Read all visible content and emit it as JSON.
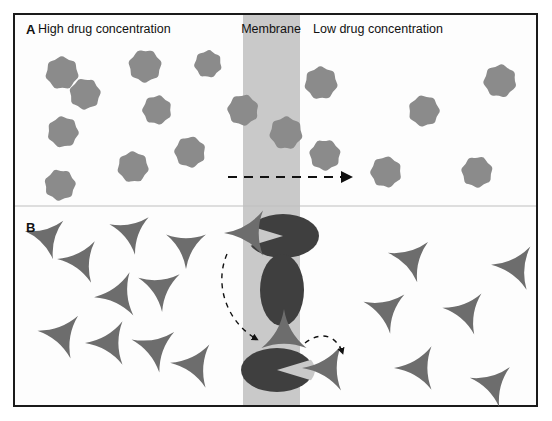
{
  "figure": {
    "frame": {
      "x": 14,
      "y": 14,
      "width": 523,
      "height": 392,
      "stroke": "#1a1a1a",
      "stroke_width": 2,
      "fill": "#fdfdfd"
    },
    "membrane": {
      "x": 243,
      "y": 14,
      "width": 57,
      "height": 392,
      "color": "#c9c9c9",
      "label": "Membrane",
      "label_x": 271,
      "label_y": 33
    }
  },
  "labels": {
    "panel_a_letter": "A",
    "panel_a_letter_x": 26,
    "panel_a_letter_y": 34,
    "panel_a_left_title": "High drug concentration",
    "panel_a_left_title_x": 38,
    "panel_a_left_title_y": 33,
    "panel_a_right_title": "Low drug concentration",
    "panel_a_right_title_x": 313,
    "panel_a_right_title_y": 33,
    "panel_b_letter": "B",
    "panel_b_letter_x": 26,
    "panel_b_letter_y": 232,
    "membrane_label": "Membrane"
  },
  "colors": {
    "drug_star": "#8b8b8b",
    "drug_triangle": "#6d6d6d",
    "transporter": "#3f3f3f",
    "membrane_band": "#c9c9c9",
    "frame_stroke": "#1a1a1a",
    "arrow": "#111111",
    "text": "#111111",
    "background": "#fdfdfd"
  },
  "panel_a": {
    "name": "passive-diffusion",
    "divider_y": 206,
    "stars_left": [
      {
        "cx": 62,
        "cy": 73,
        "r": 18,
        "rot": 12
      },
      {
        "cx": 145,
        "cy": 66,
        "r": 18,
        "rot": 40
      },
      {
        "cx": 208,
        "cy": 64,
        "r": 15,
        "rot": 70
      },
      {
        "cx": 85,
        "cy": 94,
        "r": 17,
        "rot": 95
      },
      {
        "cx": 157,
        "cy": 110,
        "r": 16,
        "rot": 25
      },
      {
        "cx": 63,
        "cy": 132,
        "r": 17,
        "rot": 55
      },
      {
        "cx": 190,
        "cy": 152,
        "r": 17,
        "rot": 80
      },
      {
        "cx": 133,
        "cy": 167,
        "r": 17,
        "rot": 10
      },
      {
        "cx": 60,
        "cy": 185,
        "r": 17,
        "rot": 45
      }
    ],
    "stars_membrane": [
      {
        "cx": 243,
        "cy": 110,
        "r": 17,
        "rot": 30
      },
      {
        "cx": 321,
        "cy": 83,
        "r": 18,
        "rot": 62
      },
      {
        "cx": 286,
        "cy": 133,
        "r": 18,
        "rot": 15
      },
      {
        "cx": 325,
        "cy": 155,
        "r": 17,
        "rot": 88
      }
    ],
    "stars_right": [
      {
        "cx": 500,
        "cy": 81,
        "r": 18,
        "rot": 20
      },
      {
        "cx": 424,
        "cy": 111,
        "r": 17,
        "rot": 50
      },
      {
        "cx": 386,
        "cy": 172,
        "r": 17,
        "rot": 75
      },
      {
        "cx": 477,
        "cy": 172,
        "r": 17,
        "rot": 35
      }
    ],
    "diffusion_arrow": {
      "x1": 228,
      "y1": 177,
      "x2": 352,
      "y2": 177,
      "dash": "9 7",
      "label": "diffusion-direction"
    }
  },
  "panel_b": {
    "name": "carrier-mediated-transport",
    "triangles_left": [
      {
        "cx": 47,
        "cy": 237,
        "s": 23,
        "rot": 195
      },
      {
        "cx": 131,
        "cy": 232,
        "s": 23,
        "rot": 200
      },
      {
        "cx": 81,
        "cy": 261,
        "s": 24,
        "rot": 185
      },
      {
        "cx": 186,
        "cy": 246,
        "s": 23,
        "rot": 210
      },
      {
        "cx": 119,
        "cy": 295,
        "s": 25,
        "rot": 175
      },
      {
        "cx": 160,
        "cy": 288,
        "s": 24,
        "rot": 205
      },
      {
        "cx": 62,
        "cy": 335,
        "s": 25,
        "rot": 190
      },
      {
        "cx": 110,
        "cy": 343,
        "s": 25,
        "rot": 180
      },
      {
        "cx": 155,
        "cy": 348,
        "s": 25,
        "rot": 200
      },
      {
        "cx": 195,
        "cy": 365,
        "s": 25,
        "rot": 185
      }
    ],
    "triangles_right": [
      {
        "cx": 411,
        "cy": 259,
        "s": 24,
        "rot": 195
      },
      {
        "cx": 516,
        "cy": 267,
        "s": 25,
        "rot": 185
      },
      {
        "cx": 386,
        "cy": 310,
        "s": 24,
        "rot": 200
      },
      {
        "cx": 466,
        "cy": 312,
        "s": 24,
        "rot": 190
      },
      {
        "cx": 419,
        "cy": 368,
        "s": 25,
        "rot": 180
      },
      {
        "cx": 493,
        "cy": 384,
        "s": 24,
        "rot": 195
      }
    ],
    "transporters": [
      {
        "name": "transporter-top-loaded",
        "cx": 283,
        "cy": 236,
        "rx": 36,
        "ry": 22,
        "notch": "left"
      },
      {
        "name": "transporter-middle-rotating",
        "cx": 282,
        "cy": 290,
        "rx": 22,
        "ry": 36,
        "notch": "none"
      },
      {
        "name": "transporter-bottom-releasing",
        "cx": 277,
        "cy": 370,
        "rx": 36,
        "ry": 22,
        "notch": "right"
      }
    ],
    "bound_drugs": [
      {
        "name": "drug-bound-top",
        "cx": 250,
        "cy": 233,
        "s": 26,
        "rot": 180
      },
      {
        "name": "drug-bound-middle",
        "cx": 284,
        "cy": 335,
        "s": 26,
        "rot": 270
      },
      {
        "name": "drug-released-bottom",
        "cx": 328,
        "cy": 368,
        "s": 26,
        "rot": 180
      }
    ],
    "curved_arrows": [
      {
        "name": "binding-arrow",
        "path": "M 227 254 C 214 284, 226 322, 258 340",
        "dash": "5 5"
      },
      {
        "name": "release-arrow",
        "path": "M 305 343 C 322 330, 337 336, 343 354",
        "dash": "5 5"
      }
    ]
  }
}
